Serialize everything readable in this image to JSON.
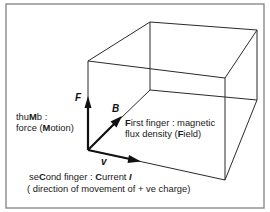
{
  "diagram": {
    "vectors": {
      "F": {
        "symbol": "F",
        "meaning": "force (thumb)"
      },
      "B": {
        "symbol": "B",
        "meaning": "magnetic flux density (first finger)"
      },
      "v": {
        "symbol": "v",
        "meaning": "current / velocity (second finger)"
      }
    },
    "labels": {
      "thumb": {
        "line1_pre": "thu",
        "line1_bold": "M",
        "line1_post": "b :",
        "line2_pre": "force (",
        "line2_bold": "M",
        "line2_post": "otion)"
      },
      "first_finger": {
        "line1_bold": "F",
        "line1_post": "irst finger : magnetic",
        "line2_pre": "flux density (",
        "line2_bold": "F",
        "line2_post": "ield)"
      },
      "second_finger": {
        "line1_pre": "se",
        "line1_bold1": "C",
        "line1_mid": "ond finger : ",
        "line1_bold2": "C",
        "line1_post": "urrent ",
        "line1_sym": "I",
        "line2": "( direction of  movement of  + ve charge)"
      }
    },
    "colors": {
      "frame": "#8a8a8a",
      "edges": "#2a2a2a",
      "vectors": "#111111",
      "text": "#1a1a1a"
    }
  }
}
